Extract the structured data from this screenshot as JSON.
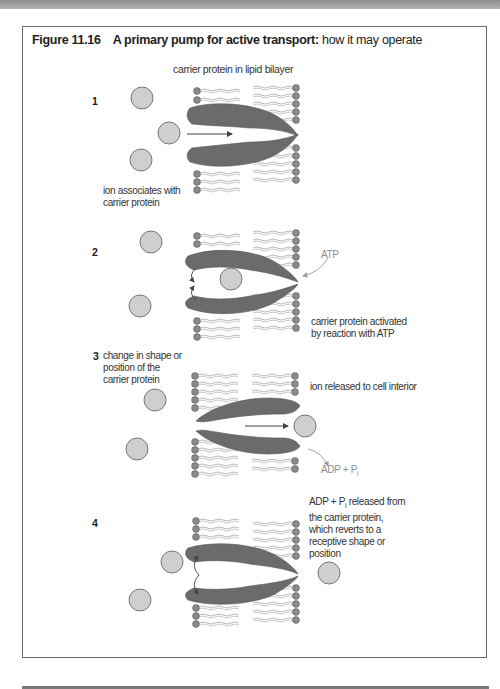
{
  "figure": {
    "number": "Figure 11.16",
    "title_bold": "A primary pump for active transport:",
    "title_rest": " how it may operate"
  },
  "header_label": "carrier protein in lipid bilayer",
  "steps": [
    {
      "number": "1",
      "caption_lines": [
        "ion associates with",
        "carrier protein"
      ]
    },
    {
      "number": "2",
      "reagent": "ATP",
      "caption_lines": [
        "carrier protein activated",
        "by reaction with ATP"
      ]
    },
    {
      "number": "3",
      "side_lines": [
        "change in shape or",
        "position of the",
        "carrier protein"
      ],
      "caption": "ion released to cell interior",
      "product_main": "ADP + P",
      "product_sub": "i"
    },
    {
      "number": "4",
      "caption_first_main": "ADP + P",
      "caption_first_sub": "i",
      "caption_first_rest": " released from",
      "caption_lines": [
        "the carrier protein,",
        "which reverts to a",
        "receptive shape or",
        "position"
      ]
    }
  ],
  "colors": {
    "protein": "#6b6b6b",
    "ion_fill": "#cfcfcf",
    "ion_stroke": "#5a5a5a",
    "lipid_head": "#8a8a8a",
    "lipid_tail": "#a8a8a8",
    "frame": "#6a6a6a",
    "grey_label": "#8d8d8d"
  }
}
